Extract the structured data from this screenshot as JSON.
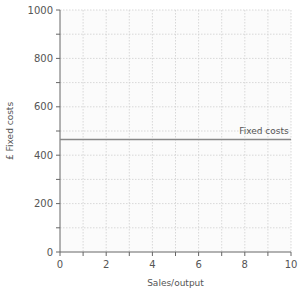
{
  "chart_data": {
    "type": "line",
    "title": "",
    "xlabel": "Sales/output",
    "ylabel": "£ Fixed costs",
    "xlim": [
      0,
      10
    ],
    "ylim": [
      0,
      1000
    ],
    "x_ticks": [
      0,
      2,
      4,
      6,
      8,
      10
    ],
    "y_ticks": [
      0,
      200,
      400,
      600,
      800,
      1000
    ],
    "x_tick_labels": [
      "0",
      "2",
      "4",
      "6",
      "8",
      "10"
    ],
    "y_tick_labels": [
      "0",
      "200",
      "400",
      "600",
      "800",
      "1000"
    ],
    "grid": true,
    "grid_minor_x_step": 1,
    "grid_minor_y_step": 100,
    "series": [
      {
        "name": "Fixed costs",
        "x": [
          0,
          10
        ],
        "values": [
          465,
          465
        ],
        "color": "#888888"
      }
    ],
    "annotations": [
      {
        "text": "Fixed costs",
        "x": 9.9,
        "y": 465,
        "position": "above-right"
      }
    ],
    "legend": "none"
  }
}
